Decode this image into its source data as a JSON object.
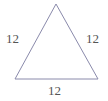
{
  "figure": {
    "name": "equilateral-triangle-with-side-lengths",
    "shape": "triangle",
    "background_color": "#ffffff",
    "stroke_color": "#8a8aab",
    "stroke_width": 1,
    "label_color": "#555555",
    "canvas": {
      "width": 108,
      "height": 101
    },
    "vertices": {
      "apex": {
        "x": 56,
        "y": 4
      },
      "bottom_left": {
        "x": 15,
        "y": 79
      },
      "bottom_right": {
        "x": 98,
        "y": 79
      }
    },
    "labels": {
      "left_side": "12",
      "right_side": "12",
      "bottom_side": "12"
    }
  }
}
